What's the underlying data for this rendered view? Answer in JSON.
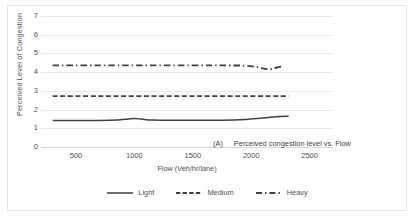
{
  "figure": {
    "caption_tag": "(A)",
    "caption_text": "Perceived congestion level vs. Flow"
  },
  "chart_data": {
    "type": "line",
    "title": "",
    "subtitle": "",
    "xlabel": "Flow (Veh/hr/lane)",
    "ylabel": "Perceived Level of Congestion",
    "xlim": [
      200,
      2700
    ],
    "ylim": [
      0,
      7
    ],
    "xticks": [
      500,
      1000,
      1500,
      2000,
      2500
    ],
    "xtick_labels": [
      "500",
      "1000",
      "1500",
      "2000",
      "2500"
    ],
    "yticks": [
      0,
      1,
      2,
      3,
      4,
      5,
      6,
      7
    ],
    "ytick_labels": [
      "0",
      "1",
      "2",
      "3",
      "4",
      "5",
      "6",
      "7"
    ],
    "grid": "horizontal",
    "legend_position": "bottom",
    "series": [
      {
        "name": "Light",
        "style": "solid",
        "color": "#404040",
        "x": [
          300,
          500,
          700,
          850,
          950,
          1000,
          1060,
          1150,
          1300,
          1500,
          1700,
          1850,
          1950,
          2050,
          2150,
          2250,
          2320
        ],
        "values": [
          1.42,
          1.42,
          1.42,
          1.44,
          1.5,
          1.52,
          1.49,
          1.44,
          1.43,
          1.43,
          1.43,
          1.44,
          1.47,
          1.52,
          1.58,
          1.63,
          1.64
        ]
      },
      {
        "name": "Medium",
        "style": "dashed",
        "color": "#404040",
        "x": [
          300,
          700,
          1100,
          1500,
          1900,
          2150,
          2320
        ],
        "values": [
          2.72,
          2.72,
          2.72,
          2.72,
          2.72,
          2.72,
          2.72
        ]
      },
      {
        "name": "Heavy",
        "style": "dash-dot",
        "color": "#404040",
        "x": [
          300,
          700,
          1100,
          1500,
          1800,
          1950,
          2060,
          2130,
          2180,
          2240,
          2280
        ],
        "values": [
          4.36,
          4.36,
          4.36,
          4.36,
          4.36,
          4.34,
          4.26,
          4.16,
          4.17,
          4.28,
          4.32
        ]
      }
    ]
  },
  "legend": {
    "items": [
      {
        "label": "Light",
        "style": "solid"
      },
      {
        "label": "Medium",
        "style": "dashed"
      },
      {
        "label": "Heavy",
        "style": "dash-dot"
      }
    ]
  }
}
